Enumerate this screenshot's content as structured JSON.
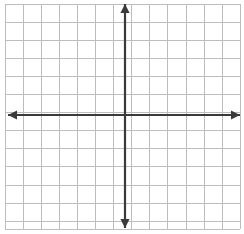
{
  "figure": {
    "width": 244,
    "height": 234,
    "background_color": "#ffffff"
  },
  "chart_data": {
    "type": "grid",
    "title": "",
    "subtitle": "",
    "xlabel": "",
    "ylabel": "",
    "series": [],
    "annotations": [],
    "legend": {
      "visible": false,
      "position": "none",
      "entries": []
    },
    "grid": {
      "visible": true,
      "color": "#bdbdbd",
      "minor_color": "#d8d8d8",
      "line_width": 1,
      "cell_width": 18.1,
      "cell_height": 18.1,
      "left": 5,
      "top": 4,
      "right": 240,
      "bottom": 229,
      "columns": 13,
      "rows": 12,
      "x_lines": [
        5,
        23.1,
        41.2,
        59.3,
        77.4,
        95.5,
        113.6,
        131.7,
        149.8,
        167.9,
        186,
        204.1,
        222.2,
        240
      ],
      "y_lines": [
        4,
        22.1,
        40.2,
        58.3,
        76.4,
        94.5,
        112.6,
        130.7,
        148.8,
        166.9,
        185,
        203.1,
        221.2,
        229
      ]
    },
    "axes": {
      "origin_x": 125,
      "origin_y": 115,
      "color": "#3a3a3a",
      "line_width": 2.2,
      "arrowheads": 4,
      "x_axis": {
        "label": "x-axis",
        "orientation": "horizontal",
        "start_x": 8,
        "end_x": 240,
        "y": 115,
        "tick_labels": [],
        "range": [
          -6.5,
          6.4
        ]
      },
      "y_axis": {
        "label": "y-axis",
        "orientation": "vertical",
        "start_y": 4,
        "end_y": 228,
        "x": 125,
        "tick_labels": [],
        "range": [
          -6.3,
          6.1
        ]
      }
    },
    "ticks": {
      "x": [],
      "y": [],
      "visible": false
    },
    "data_points": []
  },
  "colors": {
    "axis": "#3a3a3a",
    "grid_major": "#bdbdbd",
    "grid_minor": "#d8d8d8",
    "background": "#ffffff"
  }
}
